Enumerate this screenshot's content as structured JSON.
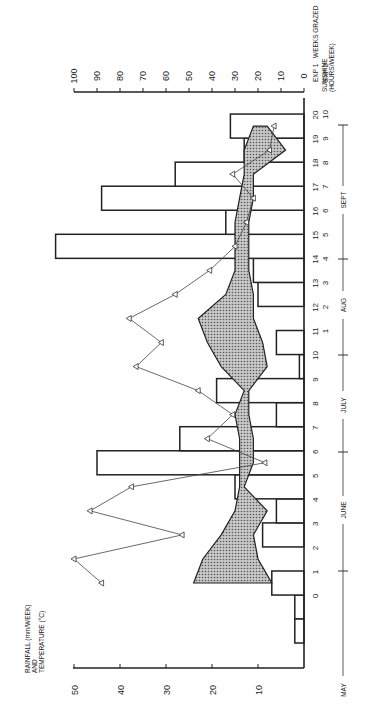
{
  "chart_data": {
    "type": "bar",
    "orientation": "rotated-90-ccw",
    "title": "",
    "ylabel_left": "RAINFALL (mm/WEEK) AND TEMPERATURE (°C)",
    "ylabel_right": "SUNSHINE (HOURS/WEEK)",
    "xlabel": "WEEKS GRAZED",
    "x_rows": [
      "EXP 1",
      "EXP 2"
    ],
    "left_axis": {
      "ticks": [
        10,
        20,
        30,
        40,
        50
      ],
      "range": [
        0,
        50
      ]
    },
    "right_axis": {
      "ticks": [
        0,
        10,
        20,
        30,
        40,
        50,
        60,
        70,
        80,
        90,
        100
      ],
      "range": [
        0,
        100
      ]
    },
    "months": [
      "MAY",
      "JUNE",
      "JULY",
      "AUG",
      "SEPT"
    ],
    "exp1_weeks": [
      "0",
      "1",
      "2",
      "3",
      "4",
      "5",
      "6",
      "7",
      "8",
      "9",
      "10",
      "11",
      "12",
      "13",
      "14",
      "15",
      "16",
      "17",
      "18",
      "19",
      "20"
    ],
    "exp2_weeks": [
      "1",
      "2",
      "3",
      "4",
      "5",
      "6",
      "7",
      "8",
      "9",
      "10"
    ],
    "rainfall_mm_week": {
      "pre": [
        2,
        2
      ],
      "weeks": [
        7,
        0,
        9,
        6,
        15,
        45,
        27,
        6,
        19,
        1,
        6,
        0,
        10,
        11,
        54,
        17,
        44,
        28,
        13,
        16
      ]
    },
    "sunshine_hours_week": [
      88,
      100,
      53,
      93,
      75,
      17,
      42,
      31,
      46,
      73,
      62,
      76,
      56,
      41,
      30,
      25,
      22,
      31,
      15,
      13
    ],
    "temperature_c": {
      "max": [
        24,
        22,
        18,
        15,
        14,
        14,
        14,
        15,
        13,
        18,
        21,
        23,
        17,
        15,
        15,
        15,
        14,
        13,
        13,
        11
      ],
      "min": [
        7,
        10,
        11,
        8,
        13,
        11,
        11,
        12,
        12,
        8,
        9,
        11,
        11,
        12,
        12,
        12,
        11,
        11,
        4,
        8
      ]
    },
    "legend": {
      "rainfall": "open bars",
      "sunshine": "triangles",
      "temperature": "shaded band (max–min)"
    }
  }
}
